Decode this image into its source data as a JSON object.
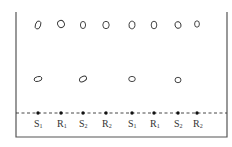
{
  "diagram": {
    "type": "thin-layer-chromatography-plate",
    "colors": {
      "line": "#555555",
      "ink": "#333333",
      "background": "#ffffff"
    },
    "lanes": [
      {
        "label": "S",
        "sub": "1",
        "x": 38,
        "spots": [
          {
            "y": 25,
            "rx": 2.6,
            "ry": 4.2,
            "rot": 20
          },
          {
            "y": 79,
            "rx": 4,
            "ry": 2.4,
            "rot": -15
          }
        ]
      },
      {
        "label": "R",
        "sub": "1",
        "x": 61,
        "spots": [
          {
            "y": 24,
            "rx": 3.3,
            "ry": 3.6,
            "rot": -30
          }
        ]
      },
      {
        "label": "S",
        "sub": "2",
        "x": 83,
        "spots": [
          {
            "y": 25,
            "rx": 2.6,
            "ry": 3.6,
            "rot": 0
          },
          {
            "y": 79,
            "rx": 3.8,
            "ry": 2.4,
            "rot": -30
          }
        ]
      },
      {
        "label": "R",
        "sub": "2",
        "x": 106,
        "spots": [
          {
            "y": 25,
            "rx": 3.2,
            "ry": 3.7,
            "rot": 0
          }
        ]
      },
      {
        "label": "S",
        "sub": "1",
        "x": 132,
        "spots": [
          {
            "y": 25,
            "rx": 3,
            "ry": 3.8,
            "rot": 10
          },
          {
            "y": 79,
            "rx": 3.3,
            "ry": 2.6,
            "rot": 0
          }
        ]
      },
      {
        "label": "R",
        "sub": "1",
        "x": 154,
        "spots": [
          {
            "y": 25,
            "rx": 2.8,
            "ry": 3.8,
            "rot": 0
          }
        ]
      },
      {
        "label": "S",
        "sub": "2",
        "x": 178,
        "spots": [
          {
            "y": 25,
            "rx": 3,
            "ry": 3.4,
            "rot": -20
          },
          {
            "y": 80,
            "rx": 3,
            "ry": 2.7,
            "rot": 0
          }
        ]
      },
      {
        "label": "R",
        "sub": "2",
        "x": 197,
        "spots": [
          {
            "y": 24,
            "rx": 2.4,
            "ry": 3.2,
            "rot": 0
          }
        ]
      }
    ],
    "plate": {
      "left": 16,
      "right": 227,
      "top": 12,
      "bottom": 137
    },
    "baseline": {
      "y": 113,
      "x1": 16,
      "x2": 227,
      "style": "dashed"
    },
    "label_y": 127
  }
}
